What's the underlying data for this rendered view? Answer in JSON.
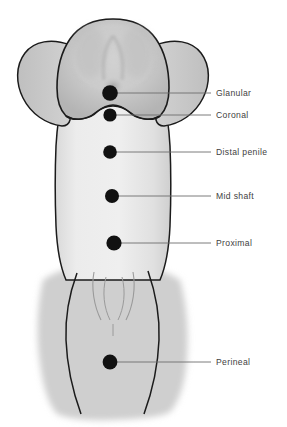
{
  "style": {
    "label_color": "#414141",
    "leader_line_color": "#6e6e6e",
    "marker_color": "#111111",
    "outline_color": "#1b1b1b",
    "skin_light": "#ebebeb",
    "skin_mid": "#d2d2d2",
    "skin_dark": "#b0b0b0",
    "background": "#ffffff"
  },
  "markers": [
    {
      "id": "glanular",
      "label": "Glanular",
      "cx": 110,
      "cy": 93,
      "r": 7.8,
      "leader_x2": 211,
      "label_x": 216,
      "label_y": 89
    },
    {
      "id": "coronal",
      "label": "Coronal",
      "cx": 110,
      "cy": 115,
      "r": 6.6,
      "leader_x2": 211,
      "label_x": 216,
      "label_y": 111
    },
    {
      "id": "distal-penile",
      "label": "Distal penile",
      "cx": 110,
      "cy": 152,
      "r": 6.8,
      "leader_x2": 211,
      "label_x": 216,
      "label_y": 148
    },
    {
      "id": "mid-shaft",
      "label": "Mid shaft",
      "cx": 112,
      "cy": 196,
      "r": 7.0,
      "leader_x2": 211,
      "label_x": 216,
      "label_y": 192
    },
    {
      "id": "proximal",
      "label": "Proximal",
      "cx": 114,
      "cy": 243,
      "r": 7.6,
      "leader_x2": 211,
      "label_x": 216,
      "label_y": 239
    },
    {
      "id": "perineal",
      "label": "Perineal",
      "cx": 110,
      "cy": 362,
      "r": 7.4,
      "leader_x2": 211,
      "label_x": 216,
      "label_y": 358
    }
  ]
}
